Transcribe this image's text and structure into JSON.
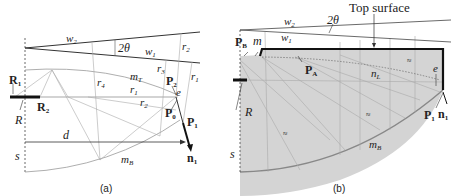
{
  "figure": {
    "panels": [
      {
        "id": "a",
        "caption": "(a)",
        "labels": {
          "w2": "w",
          "w2_sub": "2",
          "w1": "w",
          "w1_sub": "1",
          "angle": "2θ",
          "r2": "r",
          "r2_sub": "2",
          "r3": "r",
          "r3_sub": "3",
          "r1_right": "r",
          "r1_right_sub": "1",
          "r4": "r",
          "r4_sub": "4",
          "r1_mid": "r",
          "r1_mid_sub": "1",
          "r2_mid": "r",
          "r2_mid_sub": "2",
          "mT": "m",
          "mT_sub": "T",
          "mB": "m",
          "mB_sub": "B",
          "R1": "R",
          "R1_sub": "1",
          "R2": "R",
          "R2_sub": "2",
          "R": "R",
          "P2": "P",
          "P2_sub": "2",
          "P0": "P",
          "P0_sub": "0",
          "P1": "P",
          "P1_sub": "1",
          "e": "e",
          "d": "d",
          "s": "s",
          "n1": "n",
          "n1_sub": "1"
        }
      },
      {
        "id": "b",
        "caption": "(b)",
        "labels": {
          "top_surface": "Top surface",
          "w2": "w",
          "w2_sub": "2",
          "w1": "w",
          "w1_sub": "1",
          "angle": "2θ",
          "PB": "P",
          "PB_sub": "B",
          "m": "m",
          "PA": "P",
          "PA_sub": "A",
          "nL": "n",
          "nL_sub": "L",
          "e": "e",
          "R": "R",
          "s": "s",
          "P1": "P",
          "P1_sub": "1",
          "n1": "n",
          "n1_sub": "1",
          "mB": "m",
          "mB_sub": "B",
          "hatch": "≈"
        }
      }
    ],
    "colors": {
      "line": "#333333",
      "thin": "#9a9a9a",
      "fill": "#d4d4d4",
      "bold": "#111111"
    }
  }
}
